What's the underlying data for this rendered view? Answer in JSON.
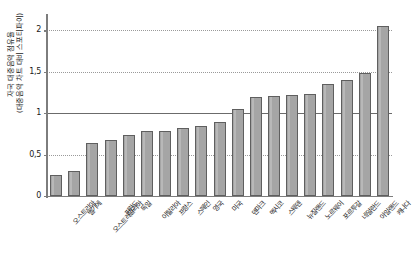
{
  "chart_data": {
    "type": "bar",
    "title": "",
    "subtitle": "",
    "xlabel": "",
    "ylabel_line1": "자국 대중음악 점유율",
    "ylabel_line2": "(대중음악 차트 대비 스포티파이)",
    "ylim": [
      0,
      2.15
    ],
    "yticks": [
      0,
      0.5,
      1,
      1.5,
      2
    ],
    "ytick_labels": [
      "0",
      "0,5",
      "1",
      "1,5",
      "2"
    ],
    "grid": true,
    "gridlines_dotted": [
      0.5,
      1.5,
      2
    ],
    "reference_line": 1,
    "legend": "none",
    "bar_color": "#a5a5a5",
    "bar_border_color": "#5f5f5f",
    "categories": [
      "오스트리아",
      "벨기에",
      "오스트레일리아",
      "핀란드",
      "독일",
      "이탈리아",
      "프랑스",
      "스페인",
      "영국",
      "미국",
      "덴마크",
      "멕시코",
      "스웨덴",
      "뉴질랜드",
      "노르웨이",
      "포르투갈",
      "네덜란드",
      "아일랜드",
      "캐나다"
    ],
    "values": [
      0.25,
      0.3,
      0.64,
      0.68,
      0.74,
      0.78,
      0.79,
      0.82,
      0.84,
      0.9,
      1.05,
      1.2,
      1.21,
      1.22,
      1.23,
      1.35,
      1.4,
      1.48,
      2.05
    ]
  }
}
